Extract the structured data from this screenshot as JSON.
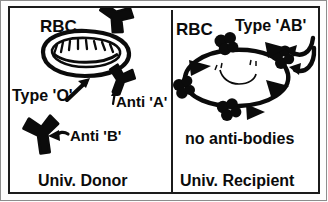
{
  "figure": {
    "ink_color": "#0b0b0b",
    "frame_color": "#1b1b1b",
    "background_color": "#ffffff"
  },
  "left_panel": {
    "name": "universal-donor-panel",
    "rbc_label": "RBC",
    "blood_type_label": "Type 'O'",
    "antibody_a_label": "Anti 'A'",
    "antibody_b_label": "Anti 'B'",
    "caption": "Univ. Donor",
    "icons": {
      "rbc": "red-blood-cell-icon",
      "antibody": "y-shaped-antibody-icon",
      "arrow_to_rbc": "arrow-up-right-icon",
      "arrow_to_anti_a": "arrow-up-icon",
      "arrow_to_anti_b": "arrow-left-icon"
    }
  },
  "right_panel": {
    "name": "universal-recipient-panel",
    "rbc_label": "RBC",
    "blood_type_label": "Type 'AB'",
    "antibody_note": "no anti-bodies",
    "caption": "Univ. Recipient",
    "icons": {
      "rbc": "red-blood-cell-icon",
      "antigen_a": "clover-blob-antigen-icon",
      "antigen_b": "triangular-spike-antigen-icon",
      "arrow_upper": "curved-arrow-left-icon",
      "arrow_lower": "curved-arrow-left-icon"
    }
  }
}
